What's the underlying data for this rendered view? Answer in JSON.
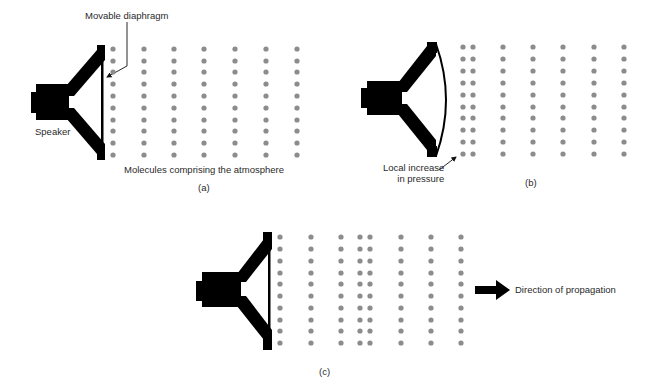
{
  "panels": [
    {
      "id": "a",
      "caption": "(a)",
      "labels": {
        "diaphragm": "Movable diaphragm",
        "speaker": "Speaker",
        "molecules": "Molecules comprising the atmosphere"
      },
      "diaphragm_shape": "flat",
      "dot_columns_x": [
        113,
        144,
        174,
        204,
        235,
        266,
        297
      ],
      "dot_rows_y": [
        49,
        61,
        72,
        84,
        96,
        108,
        120,
        131,
        143,
        155
      ]
    },
    {
      "id": "b",
      "caption": "(b)",
      "labels": {
        "pressure": "Local increase\nin pressure",
        "pressure_line1": "Local increase",
        "pressure_line2": "in pressure"
      },
      "diaphragm_shape": "bulged outward",
      "dot_columns_x": [
        463,
        473,
        503,
        533,
        563,
        594,
        624
      ],
      "dot_rows_y": [
        47,
        59,
        71,
        83,
        95,
        107,
        118,
        130,
        142,
        154
      ]
    },
    {
      "id": "c",
      "caption": "(c)",
      "labels": {
        "direction": "Direction of propagation"
      },
      "diaphragm_shape": "flat",
      "dot_columns_x": [
        280,
        311,
        341,
        360,
        370,
        401,
        431,
        461
      ],
      "dot_rows_y": [
        237,
        249,
        261,
        273,
        284,
        296,
        308,
        320,
        331,
        343
      ]
    }
  ],
  "colors": {
    "speaker": "#000000",
    "molecule": "#8c8c8c",
    "text": "#2a2a2a"
  }
}
